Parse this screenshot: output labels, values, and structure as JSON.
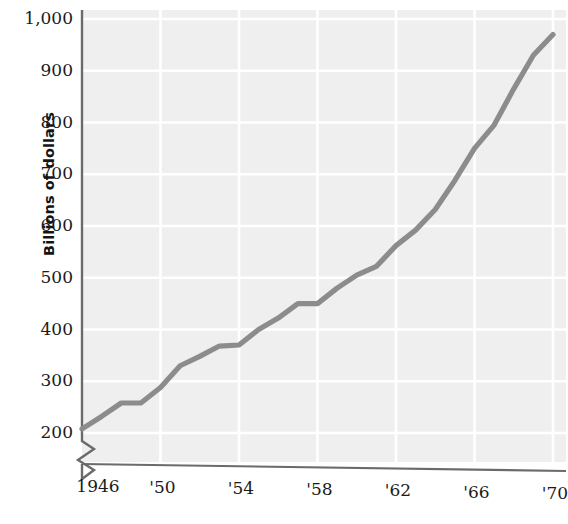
{
  "chart_data": {
    "type": "line",
    "title": "",
    "subtitle": "",
    "xlabel": "",
    "ylabel": "Billions of dollars",
    "ylim": [
      200,
      1000
    ],
    "xlim": [
      1946,
      1970
    ],
    "grid": true,
    "legend": null,
    "axis_break": true,
    "y_ticks": [
      "200",
      "300",
      "400",
      "500",
      "600",
      "700",
      "800",
      "900",
      "1,000"
    ],
    "y_tick_values": [
      200,
      300,
      400,
      500,
      600,
      700,
      800,
      900,
      1000
    ],
    "x_ticks": [
      "1946",
      "'50",
      "'54",
      "'58",
      "'62",
      "'66",
      "'70"
    ],
    "x_tick_values": [
      1946,
      1950,
      1954,
      1958,
      1962,
      1966,
      1970
    ],
    "series": [
      {
        "name": "Gross national product",
        "color": "#8c8c8c",
        "x": [
          1946,
          1947,
          1948,
          1949,
          1950,
          1951,
          1952,
          1953,
          1954,
          1955,
          1956,
          1957,
          1958,
          1959,
          1960,
          1961,
          1962,
          1963,
          1964,
          1965,
          1966,
          1967,
          1968,
          1969,
          1970
        ],
        "values": [
          208,
          232,
          258,
          258,
          288,
          330,
          348,
          368,
          370,
          400,
          422,
          450,
          450,
          480,
          505,
          522,
          562,
          592,
          632,
          688,
          750,
          795,
          865,
          930,
          970
        ]
      }
    ],
    "colors": {
      "line": "#8c8c8c",
      "grid": "#ffffff",
      "plot_background": "#efefef",
      "axis": "#6b6b6b",
      "text": "#1b1b1b"
    }
  },
  "axis": {
    "y_label": "Billions of dollars"
  }
}
